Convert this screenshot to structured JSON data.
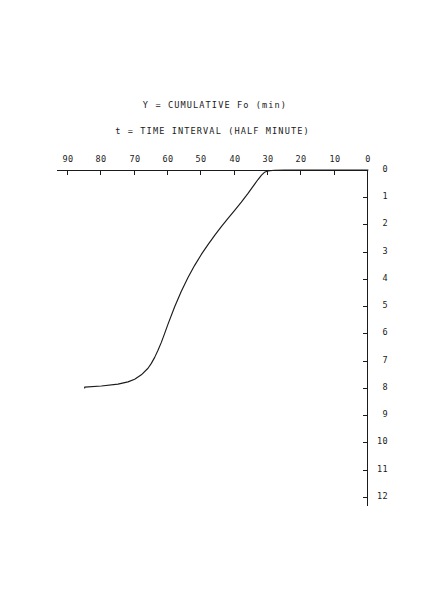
{
  "figure": {
    "rotation_degrees": 180,
    "background_color": "#ffffff",
    "line_color": "#1b1b1b"
  },
  "chart_data": {
    "type": "line",
    "title": "",
    "xlabel": "t = TIME INTERVAL (HALF MINUTE)",
    "ylabel": "Y = CUMULATIVE Fo (min)",
    "xlim": [
      0,
      93
    ],
    "ylim": [
      0,
      12.3
    ],
    "xticks": [
      0,
      10,
      20,
      30,
      40,
      50,
      60,
      70,
      80,
      90
    ],
    "xticklabels": [
      "0",
      "10",
      "20",
      "30",
      "40",
      "50",
      "60",
      "70",
      "80",
      "90"
    ],
    "yticks": [
      0,
      1,
      2,
      3,
      4,
      5,
      6,
      7,
      8,
      9,
      10,
      11,
      12
    ],
    "yticklabels": [
      "0",
      "1",
      "2",
      "3",
      "4",
      "5",
      "6",
      "7",
      "8",
      "9",
      "10",
      "11",
      "12"
    ],
    "grid": false,
    "legend": null,
    "annotations": [],
    "series": [
      {
        "name": "cumulative Fo",
        "x": [
          0,
          5,
          10,
          15,
          20,
          25,
          28,
          30,
          31,
          32,
          33,
          34,
          36,
          38,
          40,
          42,
          44,
          46,
          48,
          50,
          52,
          54,
          56,
          58,
          60,
          61,
          62,
          63,
          64,
          65,
          66,
          68,
          70,
          72,
          75,
          80,
          85,
          85
        ],
        "y": [
          0,
          0,
          0,
          0,
          0,
          0,
          0.01,
          0.03,
          0.08,
          0.2,
          0.35,
          0.52,
          0.86,
          1.18,
          1.48,
          1.78,
          2.08,
          2.4,
          2.74,
          3.1,
          3.5,
          3.95,
          4.45,
          5.02,
          5.66,
          6.0,
          6.33,
          6.62,
          6.88,
          7.1,
          7.28,
          7.52,
          7.68,
          7.78,
          7.86,
          7.93,
          7.97,
          8.0
        ]
      }
    ]
  }
}
